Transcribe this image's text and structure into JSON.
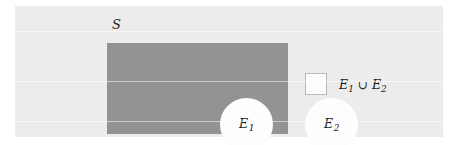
{
  "figure": {
    "type": "venn-diagram",
    "width": 455,
    "height": 145
  },
  "colors": {
    "page_background": "#ffffff",
    "panel_background": "#ececec",
    "sample_space_fill": "#939393",
    "circle_fill": "#fdfdfd",
    "swatch_fill": "#fdfdfd",
    "swatch_border": "#b9b9b9",
    "text": "#231f20"
  },
  "sample_space": {
    "label": "S"
  },
  "events": [
    {
      "name": "E1",
      "base": "E",
      "subscript": "1"
    },
    {
      "name": "E2",
      "base": "E",
      "subscript": "2"
    }
  ],
  "legend": {
    "swatch_name": "union-swatch",
    "first_base": "E",
    "first_sub": "1",
    "operator": "∪",
    "second_base": "E",
    "second_sub": "2",
    "full_label": "E1 ∪ E2"
  }
}
